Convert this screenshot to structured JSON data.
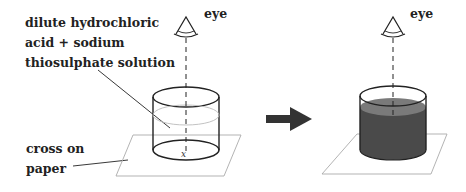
{
  "labels": {
    "solution_line1": "dilute hydrochloric",
    "solution_line2": "acid + sodium",
    "solution_line3": "thiosulphate solution",
    "cross_line1": "cross on",
    "cross_line2": "paper",
    "eye_left": "eye",
    "eye_right": "eye",
    "cross_mark": "x"
  },
  "colors": {
    "line": "#222222",
    "paper": "#aaaaaa",
    "liquid_surface": "#7a7a7a",
    "liquid_body": "#4a4a4a",
    "arrow": "#333333"
  }
}
